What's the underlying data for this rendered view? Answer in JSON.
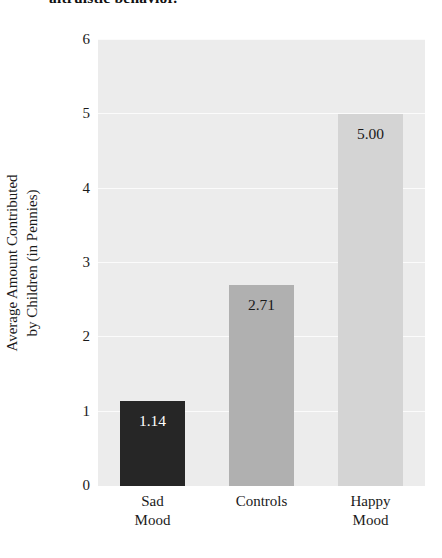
{
  "caption": {
    "text": "altruistic behavior."
  },
  "chart_data": {
    "type": "bar",
    "title": "",
    "xlabel": "",
    "ylabel_line1": "Average Amount Contributed",
    "ylabel_line2": "by Children (in Pennies)",
    "categories": [
      "Sad Mood",
      "Controls",
      "Happy Mood"
    ],
    "category_lines": [
      [
        "Sad",
        "Mood"
      ],
      [
        "Controls",
        ""
      ],
      [
        "Happy",
        "Mood"
      ]
    ],
    "values": [
      1.14,
      2.71,
      5.0
    ],
    "value_labels": [
      "1.14",
      "2.71",
      "5.00"
    ],
    "bar_colors": [
      "#262626",
      "#b0b0b0",
      "#d4d4d4"
    ],
    "value_label_colors": [
      "#ffffff",
      "#1a1a1a",
      "#1a1a1a"
    ],
    "ylim": [
      0,
      6
    ],
    "yticks": [
      0,
      1,
      2,
      3,
      4,
      5,
      6
    ],
    "ytick_labels": [
      "0",
      "1",
      "2",
      "3",
      "4",
      "5",
      "6"
    ],
    "grid": true,
    "grid_color": "#fbfbfb",
    "panel_background": "#ececec",
    "legend": "none"
  }
}
